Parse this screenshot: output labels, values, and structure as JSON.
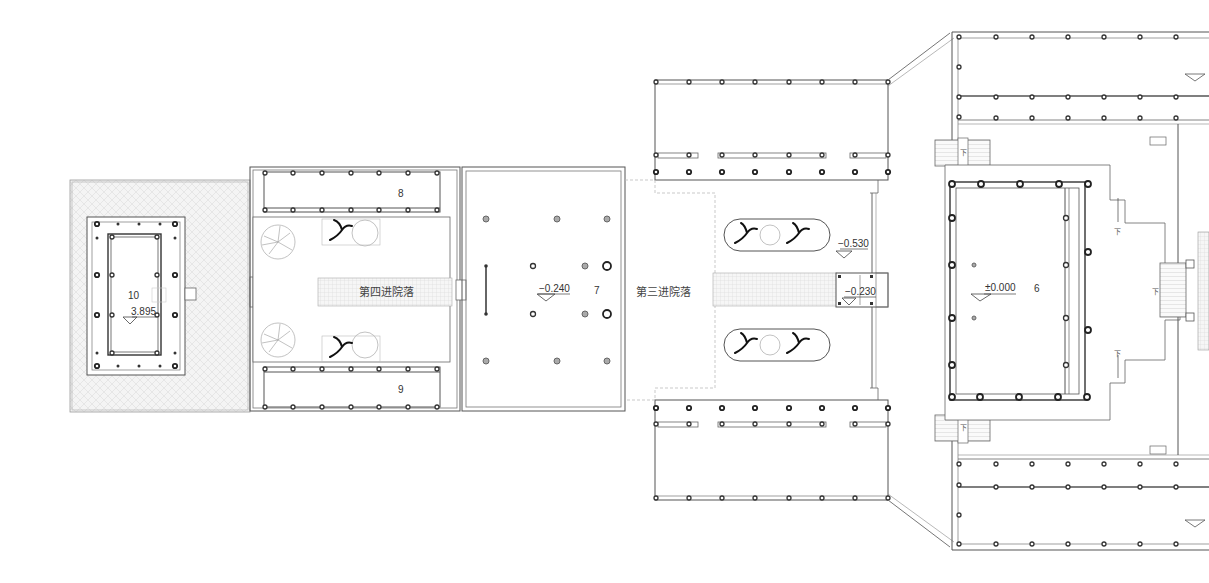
{
  "plan": {
    "type": "architectural floor plan",
    "rooms": [
      {
        "id": "10",
        "label": "10",
        "elevation": "3.895"
      },
      {
        "id": "8",
        "label": "8"
      },
      {
        "id": "9",
        "label": "9"
      },
      {
        "id": "7",
        "label": "7",
        "elevation": "−0.240"
      },
      {
        "id": "6",
        "label": "6",
        "elevation": "±0.000"
      }
    ],
    "courtyards": [
      {
        "id": "fourth",
        "label": "第四进院落"
      },
      {
        "id": "third",
        "label": "第三进院落"
      }
    ],
    "elevations": {
      "courtyard_third": "−0.530",
      "gate_third": "−0.230"
    },
    "stair_marks": {
      "down": "下"
    }
  }
}
